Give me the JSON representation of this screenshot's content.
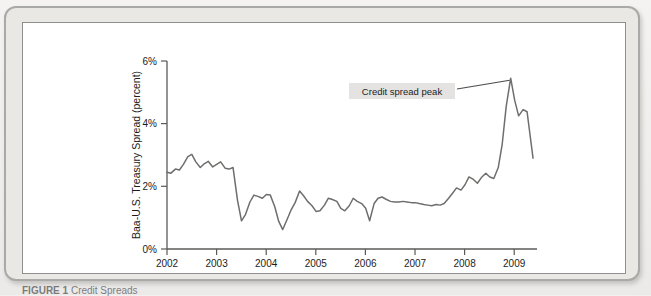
{
  "figure": {
    "caption_label": "FIGURE 1",
    "caption_body": "Credit Spreads"
  },
  "annotation": {
    "text": "Credit spread peak"
  },
  "chart_data": {
    "type": "line",
    "title": "",
    "xlabel": "",
    "ylabel": "Baa-U.S. Treasury Spread (percent)",
    "xlim": [
      2002.0,
      2009.45
    ],
    "ylim": [
      0,
      6
    ],
    "grid": false,
    "legend": "none",
    "line_color": "#6e6e6c",
    "y_ticks": [
      0,
      2,
      4,
      6
    ],
    "y_tick_labels": [
      "0%",
      "2%",
      "4%",
      "6%"
    ],
    "x_ticks": [
      2002,
      2003,
      2004,
      2005,
      2006,
      2007,
      2008,
      2009
    ],
    "x_tick_labels": [
      "2002",
      "2003",
      "2004",
      "2005",
      "2006",
      "2007",
      "2008",
      "2009"
    ],
    "series": [
      {
        "name": "Baa-U.S. Treasury Spread",
        "x": [
          2002.0,
          2002.08,
          2002.17,
          2002.25,
          2002.33,
          2002.42,
          2002.5,
          2002.58,
          2002.67,
          2002.75,
          2002.83,
          2002.92,
          2003.0,
          2003.08,
          2003.17,
          2003.25,
          2003.33,
          2003.42,
          2003.5,
          2003.58,
          2003.67,
          2003.75,
          2003.83,
          2003.92,
          2004.0,
          2004.08,
          2004.17,
          2004.25,
          2004.33,
          2004.42,
          2004.5,
          2004.58,
          2004.67,
          2004.75,
          2004.83,
          2004.92,
          2005.0,
          2005.08,
          2005.17,
          2005.25,
          2005.33,
          2005.42,
          2005.5,
          2005.58,
          2005.67,
          2005.75,
          2005.83,
          2005.92,
          2006.0,
          2006.08,
          2006.17,
          2006.25,
          2006.33,
          2006.42,
          2006.5,
          2006.58,
          2006.67,
          2006.75,
          2006.83,
          2006.92,
          2007.0,
          2007.08,
          2007.17,
          2007.25,
          2007.33,
          2007.42,
          2007.5,
          2007.58,
          2007.67,
          2007.75,
          2007.83,
          2007.92,
          2008.0,
          2008.08,
          2008.17,
          2008.25,
          2008.33,
          2008.42,
          2008.5,
          2008.58,
          2008.67,
          2008.75,
          2008.83,
          2008.92,
          2009.0,
          2009.08,
          2009.17,
          2009.25,
          2009.37
        ],
        "values": [
          2.45,
          2.42,
          2.55,
          2.52,
          2.7,
          2.95,
          3.02,
          2.78,
          2.6,
          2.72,
          2.8,
          2.62,
          2.7,
          2.78,
          2.58,
          2.55,
          2.6,
          1.55,
          0.9,
          1.1,
          1.5,
          1.72,
          1.68,
          1.62,
          1.74,
          1.72,
          1.35,
          0.88,
          0.62,
          0.95,
          1.25,
          1.48,
          1.85,
          1.7,
          1.52,
          1.38,
          1.2,
          1.22,
          1.4,
          1.62,
          1.58,
          1.52,
          1.3,
          1.22,
          1.38,
          1.62,
          1.52,
          1.45,
          1.3,
          0.9,
          1.45,
          1.62,
          1.66,
          1.58,
          1.52,
          1.5,
          1.5,
          1.52,
          1.5,
          1.48,
          1.48,
          1.45,
          1.42,
          1.4,
          1.38,
          1.42,
          1.4,
          1.45,
          1.62,
          1.78,
          1.95,
          1.88,
          2.05,
          2.3,
          2.22,
          2.1,
          2.28,
          2.42,
          2.3,
          2.25,
          2.6,
          3.35,
          4.55,
          5.45,
          4.75,
          4.25,
          4.45,
          4.38,
          2.9
        ]
      }
    ],
    "annotations": [
      {
        "text": "Credit spread peak",
        "points_to_x": 2008.92,
        "points_to_y": 5.45
      }
    ]
  }
}
